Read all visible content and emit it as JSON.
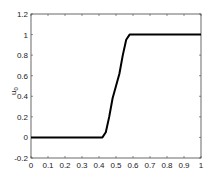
{
  "chart_data": {
    "type": "line",
    "title": "",
    "xlabel": "",
    "ylabel": "u0",
    "xlim": [
      0,
      1
    ],
    "ylim": [
      -0.2,
      1.2
    ],
    "grid": false,
    "legend": null,
    "x_ticks": [
      "0",
      "0.1",
      "0.2",
      "0.3",
      "0.4",
      "0.5",
      "0.6",
      "0.7",
      "0.8",
      "0.9",
      "1"
    ],
    "y_ticks": [
      "-0.2",
      "0",
      "0.2",
      "0.4",
      "0.6",
      "0.8",
      "1",
      "1.2"
    ],
    "series": [
      {
        "name": "u0",
        "color": "#000000",
        "x": [
          0,
          0.1,
          0.2,
          0.3,
          0.4,
          0.42,
          0.44,
          0.46,
          0.48,
          0.5,
          0.52,
          0.54,
          0.56,
          0.58,
          0.6,
          0.7,
          0.8,
          0.9,
          1.0
        ],
        "y": [
          0,
          0,
          0,
          0,
          0,
          0.0,
          0.05,
          0.2,
          0.38,
          0.5,
          0.62,
          0.8,
          0.95,
          1.0,
          1.0,
          1.0,
          1.0,
          1.0,
          1.0
        ]
      }
    ]
  }
}
